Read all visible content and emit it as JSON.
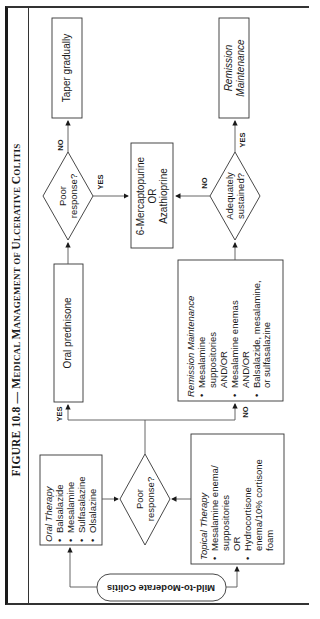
{
  "figure": {
    "title_prefix": "FIGURE 10.8 — ",
    "title_words": [
      {
        "cap": "M",
        "rest": "EDICAL "
      },
      {
        "cap": "M",
        "rest": "ANAGEMENT OF "
      },
      {
        "cap": "U",
        "rest": "LCERATIVE "
      },
      {
        "cap": "C",
        "rest": "OLITIS"
      }
    ]
  },
  "nodes": {
    "start": {
      "label": "Mild-to-Moderate Colitis"
    },
    "oral_therapy": {
      "heading": "Oral Therapy",
      "items": [
        "Balsalazide",
        "Mesalamine",
        "Sulfasalazine",
        "Olsalazine"
      ]
    },
    "topical_therapy": {
      "heading": "Topical Therapy",
      "items": [
        {
          "lines": [
            "Mesalamine enema/",
            "suppositories",
            "OR"
          ]
        },
        {
          "lines": [
            "Hydrocortisone",
            "enema/10% cortisone",
            "foam"
          ]
        }
      ]
    },
    "decision_1": {
      "line1": "Poor",
      "line2": "response?"
    },
    "oral_prednisone": {
      "label": "Oral prednisone"
    },
    "remission_list": {
      "heading": "Remission Maintenance",
      "items": [
        {
          "lines": [
            "Mesalamine",
            "suppositories",
            "AND/OR"
          ]
        },
        {
          "lines": [
            "Mesalamine enemas",
            "AND/OR"
          ]
        },
        {
          "lines": [
            "Balsalazide, mesalamine,",
            "or sulfasalazine"
          ]
        }
      ]
    },
    "decision_2": {
      "line1": "Poor",
      "line2": "response?"
    },
    "taper": {
      "label": "Taper gradually"
    },
    "immunomod": {
      "line1": "6-Mercaptopurine",
      "line2": "OR",
      "line3": "Azathioprine"
    },
    "decision_3": {
      "line1": "Adequately",
      "line2": "sustained?"
    },
    "remission_final": {
      "line1": "Remission",
      "line2": "Maintenance"
    }
  },
  "edge_labels": {
    "d1_yes": "YES",
    "d1_no": "NO",
    "d2_no": "NO",
    "d2_yes": "YES",
    "d3_no": "NO",
    "d3_yes": "YES"
  },
  "colors": {
    "line": "#555555",
    "border": "#333333",
    "text": "#1a1a1a"
  }
}
